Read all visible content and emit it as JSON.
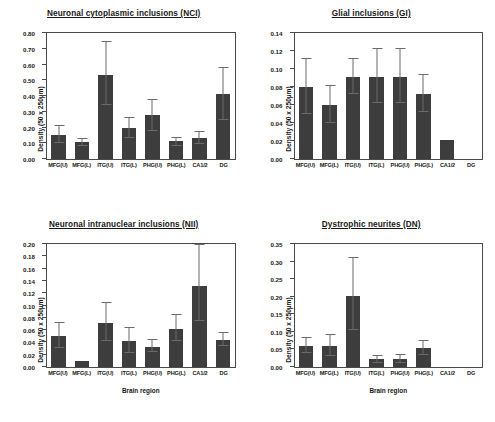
{
  "figure": {
    "xlabel": "Brain region",
    "ylabel": "Density (50 x 250µm)",
    "caption": ""
  },
  "chart_data": [
    {
      "type": "bar",
      "panel": "top-left",
      "title": "Neuronal cytoplasmic inclusions (NCI)",
      "xlabel": "",
      "ylabel": "Density (50 x 250µm)",
      "categories": [
        "MFG(U)",
        "MFG(L)",
        "ITG(U)",
        "ITG(L)",
        "PHG(U)",
        "PHG(L)",
        "CA1/2",
        "DG"
      ],
      "values": [
        0.155,
        0.105,
        0.535,
        0.198,
        0.278,
        0.112,
        0.133,
        0.41
      ],
      "errors": [
        0.055,
        0.025,
        0.2,
        0.065,
        0.1,
        0.028,
        0.04,
        0.165
      ],
      "ylim": [
        0.0,
        0.8
      ],
      "ytick_step": 0.1,
      "yticks": [
        "0.00",
        "0.10",
        "0.20",
        "0.30",
        "0.40",
        "0.50",
        "0.60",
        "0.70",
        "0.80"
      ],
      "grid": false,
      "legend": "none"
    },
    {
      "type": "bar",
      "panel": "top-right",
      "title": "Glial inclusions (GI)",
      "xlabel": "",
      "ylabel": "Density (50 x 250µm)",
      "categories": [
        "MFG(U)",
        "MFG(L)",
        "ITG(U)",
        "ITG(L)",
        "PHG(U)",
        "PHG(L)",
        "CA1/2",
        "DG"
      ],
      "values": [
        0.08,
        0.06,
        0.091,
        0.091,
        0.091,
        0.072,
        0.021,
        0.0
      ],
      "errors": [
        0.031,
        0.021,
        0.02,
        0.03,
        0.03,
        0.021,
        0.0,
        0.0
      ],
      "ylim": [
        0.0,
        0.14
      ],
      "ytick_step": 0.02,
      "yticks": [
        "0.00",
        "0.02",
        "0.04",
        "0.06",
        "0.08",
        "0.10",
        "0.12",
        "0.14"
      ],
      "grid": false,
      "legend": "none"
    },
    {
      "type": "bar",
      "panel": "bottom-left",
      "title": "Neuronal intranuclear inclusions (NII)",
      "xlabel": "Brain region",
      "ylabel": "Density (50 x 250µm)",
      "categories": [
        "MFG(U)",
        "MFG(L)",
        "ITG(U)",
        "ITG(L)",
        "PHG(U)",
        "PHG(L)",
        "CA1/2",
        "DG"
      ],
      "values": [
        0.05,
        0.01,
        0.071,
        0.042,
        0.033,
        0.062,
        0.132,
        0.044
      ],
      "errors": [
        0.021,
        0.0,
        0.031,
        0.02,
        0.01,
        0.021,
        0.06,
        0.011
      ],
      "ylim": [
        0.0,
        0.2
      ],
      "ytick_step": 0.02,
      "yticks": [
        "0.00",
        "0.02",
        "0.04",
        "0.06",
        "0.08",
        "0.10",
        "0.12",
        "0.14",
        "0.16",
        "0.18",
        "0.20"
      ],
      "grid": false,
      "legend": "none"
    },
    {
      "type": "bar",
      "panel": "bottom-right",
      "title": "Dystrophic neurites (DN)",
      "xlabel": "Brain region",
      "ylabel": "Density (50 x 250µm)",
      "categories": [
        "MFG(U)",
        "MFG(L)",
        "ITG(U)",
        "ITG(L)",
        "PHG(U)",
        "PHG(L)",
        "CA1/2",
        "DG"
      ],
      "values": [
        0.06,
        0.061,
        0.201,
        0.022,
        0.023,
        0.053,
        0.0,
        0.0
      ],
      "errors": [
        0.022,
        0.03,
        0.101,
        0.012,
        0.012,
        0.021,
        0.0,
        0.0
      ],
      "ylim": [
        0.0,
        0.35
      ],
      "ytick_step": 0.05,
      "yticks": [
        "0.00",
        "0.05",
        "0.10",
        "0.15",
        "0.20",
        "0.25",
        "0.30",
        "0.35"
      ],
      "grid": false,
      "legend": "none"
    }
  ],
  "colors": {
    "bar": "#3d3d3d",
    "axis": "#4a4a4a",
    "error": "#6b6b6b",
    "text": "#171717",
    "background": "#ffffff"
  }
}
